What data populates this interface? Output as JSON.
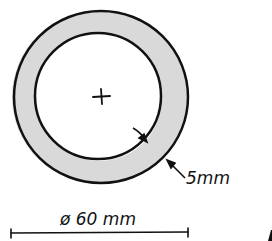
{
  "diagram": {
    "type": "pipe-cross-section",
    "center_mark": "+",
    "thickness_label": "5mm",
    "diameter_label": "ø 60 mm",
    "colors": {
      "stroke": "#111111",
      "wall_fill": "#d9d9d9",
      "background": "#ffffff"
    }
  }
}
